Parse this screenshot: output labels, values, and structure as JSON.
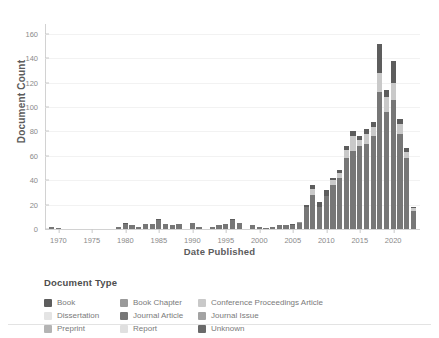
{
  "chart_data": {
    "type": "bar",
    "stacked": true,
    "title": "",
    "xlabel": "Date Published",
    "ylabel": "Document Count",
    "ylim": [
      0,
      168
    ],
    "yticks": [
      0,
      20,
      40,
      60,
      80,
      100,
      120,
      140,
      160
    ],
    "xticks": [
      1970,
      1975,
      1980,
      1985,
      1990,
      1995,
      2000,
      2005,
      2010,
      2015,
      2020
    ],
    "xlim": [
      1968,
      2024
    ],
    "grid": "horizontal",
    "legend_position": "bottom",
    "legend_title": "Document Type",
    "series": [
      {
        "name": "Book",
        "color": "#5d5d5d"
      },
      {
        "name": "Dissertation",
        "color": "#e4e4e4"
      },
      {
        "name": "Preprint",
        "color": "#b4b4b4"
      },
      {
        "name": "Book Chapter",
        "color": "#9a9a9a"
      },
      {
        "name": "Journal Article",
        "color": "#777777"
      },
      {
        "name": "Report",
        "color": "#e0e0e0"
      },
      {
        "name": "Conference Proceedings Article",
        "color": "#c9c9c9"
      },
      {
        "name": "Journal Issue",
        "color": "#a3a3a3"
      },
      {
        "name": "Unknown",
        "color": "#6a6a6a"
      }
    ],
    "categories": [
      1969,
      1970,
      1971,
      1972,
      1973,
      1974,
      1975,
      1976,
      1977,
      1978,
      1979,
      1980,
      1981,
      1982,
      1983,
      1984,
      1985,
      1986,
      1987,
      1988,
      1989,
      1990,
      1991,
      1992,
      1993,
      1994,
      1995,
      1996,
      1997,
      1998,
      1999,
      2000,
      2001,
      2002,
      2003,
      2004,
      2005,
      2006,
      2007,
      2008,
      2009,
      2010,
      2011,
      2012,
      2013,
      2014,
      2015,
      2016,
      2017,
      2018,
      2019,
      2020,
      2021,
      2022,
      2023
    ],
    "values": [
      {
        "year": 1969,
        "total": 2,
        "segments": {
          "Journal Article": 2
        }
      },
      {
        "year": 1970,
        "total": 1,
        "segments": {
          "Journal Article": 1
        }
      },
      {
        "year": 1971,
        "total": 0,
        "segments": {}
      },
      {
        "year": 1972,
        "total": 0,
        "segments": {}
      },
      {
        "year": 1973,
        "total": 0,
        "segments": {}
      },
      {
        "year": 1974,
        "total": 0,
        "segments": {}
      },
      {
        "year": 1975,
        "total": 0,
        "segments": {}
      },
      {
        "year": 1976,
        "total": 0,
        "segments": {}
      },
      {
        "year": 1977,
        "total": 0,
        "segments": {}
      },
      {
        "year": 1978,
        "total": 0,
        "segments": {}
      },
      {
        "year": 1979,
        "total": 2,
        "segments": {
          "Journal Article": 2
        }
      },
      {
        "year": 1980,
        "total": 5,
        "segments": {
          "Journal Article": 4,
          "Book": 1
        }
      },
      {
        "year": 1981,
        "total": 3,
        "segments": {
          "Journal Article": 3
        }
      },
      {
        "year": 1982,
        "total": 2,
        "segments": {
          "Journal Article": 2
        }
      },
      {
        "year": 1983,
        "total": 4,
        "segments": {
          "Journal Article": 4
        }
      },
      {
        "year": 1984,
        "total": 4,
        "segments": {
          "Journal Article": 4
        }
      },
      {
        "year": 1985,
        "total": 8,
        "segments": {
          "Journal Article": 7,
          "Book": 1
        }
      },
      {
        "year": 1986,
        "total": 4,
        "segments": {
          "Journal Article": 4
        }
      },
      {
        "year": 1987,
        "total": 3,
        "segments": {
          "Journal Article": 3
        }
      },
      {
        "year": 1988,
        "total": 4,
        "segments": {
          "Journal Article": 4
        }
      },
      {
        "year": 1989,
        "total": 0,
        "segments": {}
      },
      {
        "year": 1990,
        "total": 5,
        "segments": {
          "Journal Article": 5
        }
      },
      {
        "year": 1991,
        "total": 2,
        "segments": {
          "Journal Article": 2
        }
      },
      {
        "year": 1992,
        "total": 0,
        "segments": {}
      },
      {
        "year": 1993,
        "total": 2,
        "segments": {
          "Journal Article": 2
        }
      },
      {
        "year": 1994,
        "total": 3,
        "segments": {
          "Journal Article": 3
        }
      },
      {
        "year": 1995,
        "total": 4,
        "segments": {
          "Journal Article": 4
        }
      },
      {
        "year": 1996,
        "total": 8,
        "segments": {
          "Journal Article": 7,
          "Book": 1
        }
      },
      {
        "year": 1997,
        "total": 5,
        "segments": {
          "Journal Article": 5
        }
      },
      {
        "year": 1998,
        "total": 0,
        "segments": {}
      },
      {
        "year": 1999,
        "total": 3,
        "segments": {
          "Journal Article": 3
        }
      },
      {
        "year": 2000,
        "total": 2,
        "segments": {
          "Journal Article": 2
        }
      },
      {
        "year": 2001,
        "total": 1,
        "segments": {
          "Journal Article": 1
        }
      },
      {
        "year": 2002,
        "total": 2,
        "segments": {
          "Journal Article": 2
        }
      },
      {
        "year": 2003,
        "total": 3,
        "segments": {
          "Journal Article": 3
        }
      },
      {
        "year": 2004,
        "total": 3,
        "segments": {
          "Journal Article": 3
        }
      },
      {
        "year": 2005,
        "total": 4,
        "segments": {
          "Journal Article": 3,
          "Book": 1
        }
      },
      {
        "year": 2006,
        "total": 6,
        "segments": {
          "Journal Article": 5,
          "Book Chapter": 1
        }
      },
      {
        "year": 2007,
        "total": 20,
        "segments": {
          "Journal Article": 18,
          "Book": 2
        }
      },
      {
        "year": 2008,
        "total": 36,
        "segments": {
          "Journal Article": 28,
          "Conference Proceedings Article": 5,
          "Book": 3
        }
      },
      {
        "year": 2009,
        "total": 22,
        "segments": {
          "Journal Article": 18,
          "Book": 4
        }
      },
      {
        "year": 2010,
        "total": 32,
        "segments": {
          "Journal Article": 27,
          "Book": 5
        }
      },
      {
        "year": 2011,
        "total": 42,
        "segments": {
          "Journal Article": 36,
          "Conference Proceedings Article": 4,
          "Book": 2
        }
      },
      {
        "year": 2012,
        "total": 48,
        "segments": {
          "Journal Article": 42,
          "Conference Proceedings Article": 4,
          "Book": 2
        }
      },
      {
        "year": 2013,
        "total": 68,
        "segments": {
          "Journal Article": 58,
          "Conference Proceedings Article": 7,
          "Book": 3
        }
      },
      {
        "year": 2014,
        "total": 80,
        "segments": {
          "Journal Article": 64,
          "Conference Proceedings Article": 12,
          "Book": 4
        }
      },
      {
        "year": 2015,
        "total": 76,
        "segments": {
          "Journal Article": 68,
          "Conference Proceedings Article": 5,
          "Book": 3
        }
      },
      {
        "year": 2016,
        "total": 82,
        "segments": {
          "Journal Article": 70,
          "Conference Proceedings Article": 8,
          "Book": 4
        }
      },
      {
        "year": 2017,
        "total": 88,
        "segments": {
          "Journal Article": 76,
          "Conference Proceedings Article": 8,
          "Book": 4
        }
      },
      {
        "year": 2018,
        "total": 152,
        "segments": {
          "Journal Article": 112,
          "Conference Proceedings Article": 16,
          "Book": 24
        }
      },
      {
        "year": 2019,
        "total": 114,
        "segments": {
          "Journal Article": 96,
          "Conference Proceedings Article": 12,
          "Book": 6
        }
      },
      {
        "year": 2020,
        "total": 138,
        "segments": {
          "Journal Article": 106,
          "Conference Proceedings Article": 14,
          "Book": 18
        }
      },
      {
        "year": 2021,
        "total": 90,
        "segments": {
          "Journal Article": 78,
          "Conference Proceedings Article": 8,
          "Book": 4
        }
      },
      {
        "year": 2022,
        "total": 66,
        "segments": {
          "Journal Article": 58,
          "Conference Proceedings Article": 5,
          "Book": 3
        }
      },
      {
        "year": 2023,
        "total": 18,
        "segments": {
          "Journal Article": 15,
          "Conference Proceedings Article": 2,
          "Book": 1
        }
      }
    ]
  },
  "legend": {
    "title": "Document Type",
    "columns": [
      [
        {
          "label": "Book",
          "color": "#5d5d5d"
        },
        {
          "label": "Dissertation",
          "color": "#e4e4e4"
        },
        {
          "label": "Preprint",
          "color": "#b4b4b4"
        }
      ],
      [
        {
          "label": "Book Chapter",
          "color": "#9a9a9a"
        },
        {
          "label": "Journal Article",
          "color": "#777777"
        },
        {
          "label": "Report",
          "color": "#e0e0e0"
        }
      ],
      [
        {
          "label": "Conference Proceedings Article",
          "color": "#c9c9c9"
        },
        {
          "label": "Journal Issue",
          "color": "#a3a3a3"
        },
        {
          "label": "Unknown",
          "color": "#6a6a6a"
        }
      ]
    ]
  },
  "axes": {
    "y_title": "Document Count",
    "x_title": "Date Published"
  }
}
